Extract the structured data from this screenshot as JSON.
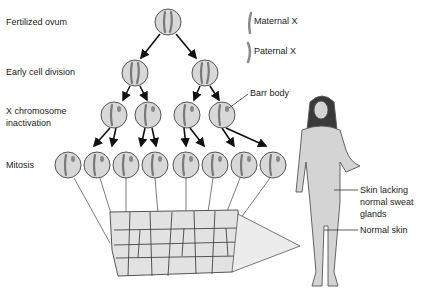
{
  "figure": {
    "stage_labels": {
      "fertilized_ovum": "Fertilized ovum",
      "early_cell_division": "Early cell division",
      "x_inactivation_line1": "X chromosome",
      "x_inactivation_line2": "inactivation",
      "mitosis": "Mitosis"
    },
    "legend": {
      "maternal": "Maternal X",
      "paternal": "Paternal X"
    },
    "annotations": {
      "barr_body": "Barr body",
      "skin_lacking_line1": "Skin lacking",
      "skin_lacking_line2": "normal sweat",
      "skin_lacking_line3": "glands",
      "normal_skin": "Normal skin"
    },
    "colors": {
      "cell_fill": "#d8d8d8",
      "cell_stroke": "#555555",
      "chromosome": "#8a8a8a",
      "skin": "#d4d4d4",
      "hair": "#3a3a3a",
      "tissue_fill": "#e2e2e2"
    }
  }
}
